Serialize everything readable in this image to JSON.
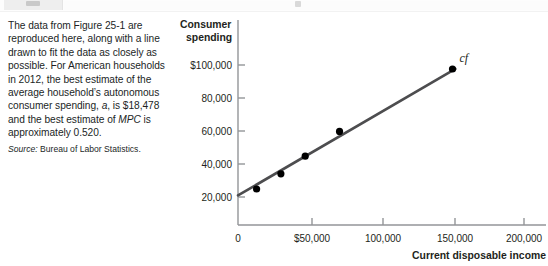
{
  "chrome": {
    "tab_icon": "tab-thumbnail",
    "marker_icon": "page-marker"
  },
  "text_panel": {
    "lines": [
      "The data from Figure 25-1 are",
      "reproduced here, along with a line",
      "drawn to fit the data as closely as",
      "possible. For American households",
      "in 2012, the best estimate of the",
      "average household’s autonomous",
      "consumer spending, a, is $18,478",
      "and the best estimate of MPC is",
      "approximately 0.520."
    ],
    "italic_terms": [
      "a",
      "MPC"
    ],
    "source_label": "Source:",
    "source_text": "Bureau of Labor Statistics."
  },
  "chart_data": {
    "type": "scatter",
    "title": "",
    "ylabel": "Consumer spending",
    "xlabel": "Current disposable income",
    "series_label": "cf",
    "x": [
      13000,
      30000,
      47000,
      71000,
      150000
    ],
    "y": [
      22500,
      32000,
      43000,
      58500,
      97500
    ],
    "xlim": [
      0,
      215000
    ],
    "ylim": [
      0,
      115000
    ],
    "xticks": [
      0,
      50000,
      100000,
      150000,
      200000
    ],
    "xtick_labels": [
      "0",
      "$50,000",
      "100,000",
      "150,000",
      "200,000"
    ],
    "yticks": [
      20000,
      40000,
      60000,
      80000,
      100000
    ],
    "ytick_labels": [
      "20,000",
      "40,000",
      "60,000",
      "80,000",
      "$100,000"
    ],
    "grid": false,
    "legend": "none",
    "fit_line": {
      "intercept": 18478,
      "slope": 0.52,
      "x_start": 0,
      "x_end": 152000,
      "color": "#4d4d4f"
    },
    "point_color": "#000000",
    "axis_color": "#939598"
  }
}
